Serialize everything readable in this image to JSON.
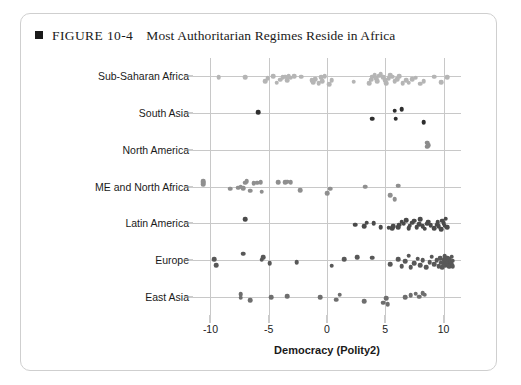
{
  "figure": {
    "marker": "black-square-icon",
    "number": "FIGURE 10-4",
    "title": "Most Authoritarian Regimes Reside in Africa"
  },
  "chart_data": {
    "type": "scatter",
    "title": "Most Authoritarian Regimes Reside in Africa",
    "xlabel": "Democracy (Polity2)",
    "ylabel": "",
    "xlim": [
      -11.5,
      11.5
    ],
    "xticks": [
      -10,
      -5,
      0,
      5,
      10
    ],
    "xticklabels": [
      "-10",
      "-5",
      "0",
      "5",
      "10"
    ],
    "grid": true,
    "grid_color": "#c8c8c8",
    "categories": [
      "Sub-Saharan Africa",
      "South Asia",
      "North America",
      "ME and North Africa",
      "Latin America",
      "Europe",
      "East Asia"
    ],
    "colors": {
      "sub_saharan_africa": "#b5b5b5",
      "south_asia": "#2e2e2e",
      "north_america": "#8c8c8c",
      "me_north_africa": "#8f8f8f",
      "latin_america": "#4a4a4a",
      "europe": "#585858",
      "east_asia": "#6e6e6e"
    },
    "series": [
      {
        "name": "Sub-Saharan Africa",
        "color": "#b5b5b5",
        "points": [
          [
            -9.3,
            0.04
          ],
          [
            -7.0,
            0.04
          ],
          [
            -5.3,
            0.3
          ],
          [
            -5.1,
            0.12
          ],
          [
            -4.6,
            -0.02
          ],
          [
            -4.3,
            0.38
          ],
          [
            -4.0,
            0.2
          ],
          [
            -3.8,
            0.06
          ],
          [
            -3.6,
            0.02
          ],
          [
            -3.4,
            0.22
          ],
          [
            -3.3,
            -0.02
          ],
          [
            -3.1,
            0.08
          ],
          [
            -2.8,
            0.0
          ],
          [
            -2.2,
            0.02
          ],
          [
            -1.3,
            0.22
          ],
          [
            -1.2,
            0.34
          ],
          [
            -1.0,
            0.16
          ],
          [
            -0.7,
            0.42
          ],
          [
            -0.5,
            0.06
          ],
          [
            -0.4,
            0.28
          ],
          [
            -0.2,
            0.0
          ],
          [
            0.2,
            0.46
          ],
          [
            0.4,
            0.22
          ],
          [
            2.3,
            0.32
          ],
          [
            3.6,
            0.42
          ],
          [
            3.8,
            0.2
          ],
          [
            3.9,
            0.02
          ],
          [
            4.1,
            -0.08
          ],
          [
            4.2,
            0.12
          ],
          [
            4.3,
            0.3
          ],
          [
            4.5,
            -0.04
          ],
          [
            4.6,
            -0.14
          ],
          [
            4.8,
            0.06
          ],
          [
            5.0,
            0.22
          ],
          [
            5.1,
            0.4
          ],
          [
            5.3,
            0.1
          ],
          [
            5.4,
            -0.06
          ],
          [
            5.6,
            0.02
          ],
          [
            5.8,
            0.3
          ],
          [
            6.0,
            0.16
          ],
          [
            6.2,
            -0.02
          ],
          [
            6.5,
            0.42
          ],
          [
            6.8,
            0.24
          ],
          [
            7.0,
            0.38
          ],
          [
            7.3,
            0.18
          ],
          [
            7.6,
            0.08
          ],
          [
            8.0,
            0.44
          ],
          [
            8.3,
            0.28
          ],
          [
            9.2,
            0.02
          ],
          [
            9.8,
            0.34
          ],
          [
            10.3,
            0.06
          ]
        ]
      },
      {
        "name": "South Asia",
        "color": "#2e2e2e",
        "points": [
          [
            -5.9,
            -0.05
          ],
          [
            3.9,
            0.33
          ],
          [
            5.9,
            0.33
          ],
          [
            5.8,
            -0.13
          ],
          [
            6.4,
            -0.22
          ],
          [
            8.3,
            0.53
          ]
        ]
      },
      {
        "name": "North America",
        "color": "#8c8c8c",
        "points": [
          [
            8.6,
            -0.18
          ],
          [
            8.7,
            -0.26
          ],
          [
            8.6,
            -0.42
          ]
        ]
      },
      {
        "name": "ME and North Africa",
        "color": "#8f8f8f",
        "points": [
          [
            -10.6,
            -0.12
          ],
          [
            -10.6,
            -0.22
          ],
          [
            -10.6,
            -0.3
          ],
          [
            -8.3,
            0.14
          ],
          [
            -7.6,
            0.06
          ],
          [
            -7.4,
            0.02
          ],
          [
            -7.2,
            0.1
          ],
          [
            -7.0,
            -0.22
          ],
          [
            -6.9,
            -0.32
          ],
          [
            -6.6,
            0.26
          ],
          [
            -6.3,
            -0.2
          ],
          [
            -6.0,
            -0.22
          ],
          [
            -5.7,
            -0.24
          ],
          [
            -5.6,
            0.3
          ],
          [
            -4.2,
            -0.26
          ],
          [
            -3.6,
            -0.26
          ],
          [
            -3.4,
            -0.28
          ],
          [
            -3.1,
            -0.26
          ],
          [
            -2.3,
            0.22
          ],
          [
            0.0,
            0.4
          ],
          [
            0.3,
            0.14
          ],
          [
            3.3,
            0.02
          ],
          [
            5.4,
            0.52
          ],
          [
            5.8,
            0.74
          ],
          [
            6.1,
            -0.04
          ]
        ]
      },
      {
        "name": "Latin America",
        "color": "#4a4a4a",
        "points": [
          [
            -7.0,
            -0.22
          ],
          [
            2.4,
            0.1
          ],
          [
            3.2,
            0.16
          ],
          [
            3.4,
            -0.04
          ],
          [
            4.0,
            0.0
          ],
          [
            4.6,
            0.22
          ],
          [
            5.3,
            0.26
          ],
          [
            5.6,
            0.3
          ],
          [
            5.7,
            0.18
          ],
          [
            6.1,
            0.24
          ],
          [
            6.2,
            0.1
          ],
          [
            6.4,
            -0.08
          ],
          [
            6.6,
            0.02
          ],
          [
            6.8,
            -0.18
          ],
          [
            7.0,
            0.3
          ],
          [
            7.1,
            0.14
          ],
          [
            7.3,
            -0.04
          ],
          [
            7.5,
            -0.14
          ],
          [
            7.7,
            0.24
          ],
          [
            7.9,
            0.06
          ],
          [
            8.0,
            -0.22
          ],
          [
            8.2,
            0.18
          ],
          [
            8.4,
            0.32
          ],
          [
            8.6,
            0.02
          ],
          [
            8.7,
            -0.1
          ],
          [
            8.9,
            0.12
          ],
          [
            9.2,
            0.28
          ],
          [
            9.4,
            0.08
          ],
          [
            9.5,
            -0.06
          ],
          [
            9.6,
            0.18
          ],
          [
            9.8,
            0.34
          ],
          [
            9.9,
            -0.16
          ],
          [
            10.0,
            0.0
          ],
          [
            10.1,
            0.14
          ],
          [
            10.2,
            -0.26
          ],
          [
            10.3,
            0.22
          ]
        ]
      },
      {
        "name": "Europe",
        "color": "#585858",
        "points": [
          [
            -9.5,
            0.3
          ],
          [
            -9.7,
            -0.06
          ],
          [
            -7.2,
            -0.36
          ],
          [
            -5.6,
            -0.02
          ],
          [
            -5.5,
            -0.16
          ],
          [
            -4.9,
            0.2
          ],
          [
            -2.6,
            0.12
          ],
          [
            0.4,
            0.34
          ],
          [
            1.5,
            -0.06
          ],
          [
            2.6,
            -0.16
          ],
          [
            3.9,
            -0.12
          ],
          [
            5.4,
            0.26
          ],
          [
            6.1,
            -0.04
          ],
          [
            6.4,
            0.38
          ],
          [
            6.7,
            0.06
          ],
          [
            7.0,
            -0.24
          ],
          [
            7.2,
            0.44
          ],
          [
            7.5,
            0.18
          ],
          [
            7.8,
            -0.08
          ],
          [
            8.0,
            0.3
          ],
          [
            8.2,
            0.0
          ],
          [
            8.5,
            0.42
          ],
          [
            8.8,
            0.12
          ],
          [
            9.0,
            -0.18
          ],
          [
            9.2,
            0.26
          ],
          [
            9.4,
            0.02
          ],
          [
            9.6,
            0.36
          ],
          [
            9.7,
            -0.1
          ],
          [
            9.8,
            0.16
          ],
          [
            9.9,
            0.44
          ],
          [
            10.0,
            -0.02
          ],
          [
            10.0,
            0.22
          ],
          [
            10.1,
            0.08
          ],
          [
            10.1,
            -0.22
          ],
          [
            10.2,
            0.34
          ],
          [
            10.2,
            0.0
          ],
          [
            10.3,
            0.18
          ],
          [
            10.3,
            -0.12
          ],
          [
            10.4,
            0.28
          ],
          [
            10.4,
            0.06
          ],
          [
            10.5,
            0.4
          ],
          [
            10.5,
            -0.04
          ],
          [
            10.6,
            0.14
          ],
          [
            10.6,
            0.3
          ],
          [
            10.7,
            -0.18
          ],
          [
            10.7,
            0.22
          ],
          [
            10.8,
            0.04
          ],
          [
            10.8,
            0.36
          ]
        ]
      },
      {
        "name": "East Asia",
        "color": "#6e6e6e",
        "points": [
          [
            -7.4,
            0.06
          ],
          [
            -7.4,
            -0.14
          ],
          [
            -6.6,
            0.22
          ],
          [
            -4.8,
            0.04
          ],
          [
            -3.4,
            -0.02
          ],
          [
            -0.6,
            0.02
          ],
          [
            0.8,
            0.18
          ],
          [
            1.1,
            -0.12
          ],
          [
            3.2,
            0.28
          ],
          [
            4.8,
            0.36
          ],
          [
            5.1,
            0.1
          ],
          [
            5.2,
            0.44
          ],
          [
            6.7,
            0.04
          ],
          [
            7.2,
            -0.08
          ],
          [
            7.6,
            -0.18
          ],
          [
            7.9,
            0.0
          ],
          [
            8.2,
            -0.22
          ],
          [
            8.4,
            -0.12
          ]
        ]
      }
    ]
  },
  "axes": {
    "x_title": "Democracy (Polity2)",
    "x_tick_labels": [
      "-10",
      "-5",
      "0",
      "5",
      "10"
    ],
    "y_tick_labels": [
      "Sub-Saharan Africa",
      "South Asia",
      "North America",
      "ME and North Africa",
      "Latin America",
      "Europe",
      "East Asia"
    ]
  }
}
